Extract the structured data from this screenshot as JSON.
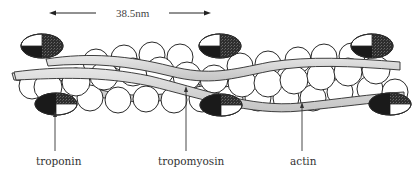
{
  "diagram": {
    "scale_bar": {
      "label": "38.5nm"
    },
    "labels": {
      "troponin": "troponin",
      "tropomyosin": "tropomyosin",
      "actin": "actin"
    },
    "components": [
      {
        "name": "troponin",
        "description": "Troponin complex shown as half-white, half-dark ellipses, in pairs above and below filament"
      },
      {
        "name": "tropomyosin",
        "description": "Gray ribbon strands winding along the actin helix"
      },
      {
        "name": "actin",
        "description": "Chain of white circular monomers forming double helix"
      }
    ],
    "colors": {
      "troponin_dark": "#1a1a1a",
      "troponin_shaded": "#3d3d3d",
      "tropomyosin": "#d4d4d4",
      "actin_fill": "#ffffff",
      "outline": "#2a2a2a"
    }
  }
}
